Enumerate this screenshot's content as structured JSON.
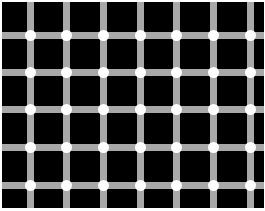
{
  "image": {
    "subject": "Scintillating grid illusion",
    "background_color": "#000000",
    "bar_color": "#a8a8a8",
    "dot_color": "#ffffff",
    "vertical_bar_centers_x": [
      30,
      66,
      103,
      140,
      176,
      213,
      250
    ],
    "horizontal_bar_centers_y": [
      35,
      72,
      109,
      147,
      185
    ],
    "bar_width": 7,
    "dot_diameter": 11
  }
}
